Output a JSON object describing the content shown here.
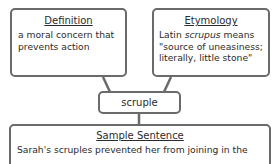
{
  "term": "scruple",
  "definition": {
    "heading": "Definition",
    "text": "a moral concern that prevents action"
  },
  "etymology": {
    "heading": "Etymology",
    "line1_prefix": "Latin ",
    "line1_italic": "scrupus",
    "line1_suffix": " means",
    "line2": "\"source of uneasiness;",
    "line3": "literally, little stone\""
  },
  "sample_sentence": {
    "heading": "Sample Sentence",
    "text": "Sarah's scruples prevented her from joining in the"
  },
  "colors": {
    "border": "#6a6a6a",
    "text": "#2b2b2b",
    "background": "#ffffff"
  }
}
